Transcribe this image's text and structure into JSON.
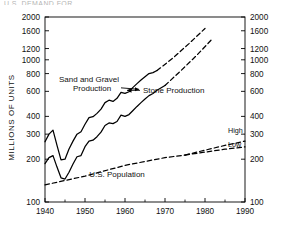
{
  "figure": {
    "top_cut_text": "U.S. DEMAND FOR",
    "frame": {
      "left": 45,
      "right": 245,
      "top": 17,
      "bottom": 202
    }
  },
  "chart_data": {
    "type": "line",
    "title": "",
    "subtitle": "",
    "xlabel": "",
    "ylabel": "MILLIONS OF UNITS",
    "yscale": "log",
    "xlim": [
      1940,
      1990
    ],
    "ylim": [
      100,
      2000
    ],
    "grid": false,
    "legend": "annotations-inline",
    "yticks": [
      100,
      200,
      300,
      400,
      600,
      800,
      1000,
      1200,
      1600,
      2000
    ],
    "ytick_labels": [
      "100",
      "200",
      "300",
      "400",
      "600",
      "800",
      "1000",
      "1200",
      "1600",
      "2000"
    ],
    "yticks_right": [
      100,
      200,
      300,
      400,
      600,
      800,
      1000,
      1200,
      1600,
      2000
    ],
    "ytick_labels_right": [
      "100",
      "200",
      "300",
      "400",
      "600",
      "800",
      "1000",
      "1200",
      "1600",
      "2000"
    ],
    "xticks": [
      1940,
      1950,
      1960,
      1970,
      1980,
      1990
    ],
    "xtick_labels": [
      "1940",
      "1950",
      "1960",
      "1970",
      "1980",
      "1990"
    ],
    "xticks_minor": [
      1945,
      1955,
      1965,
      1975,
      1985
    ],
    "annotations": [
      {
        "name": "sand-and-gravel-label",
        "text": "Sand and Gravel\nProduction",
        "line1": "Sand and Gravel",
        "line2": "Production",
        "x": 1943.5,
        "y": 700,
        "arrow": "right"
      },
      {
        "name": "stone-production-label",
        "text": "Stone Production",
        "x": 1964.5,
        "y": 610,
        "arrow": "left"
      },
      {
        "name": "us-population-label",
        "text": "U.S. Population",
        "x": 1958,
        "y": 150,
        "arrow": "none"
      },
      {
        "name": "high-branch-label",
        "text": "High",
        "x": 1985,
        "y": 300,
        "arrow": "none"
      },
      {
        "name": "low-branch-label",
        "text": "Low",
        "x": 1985,
        "y": 248,
        "arrow": "none"
      }
    ],
    "series": [
      {
        "name": "Sand and Gravel Production",
        "style": "solid",
        "color": "#000000",
        "x": [
          1940,
          1941,
          1942,
          1943,
          1944,
          1945,
          1946,
          1947,
          1948,
          1949,
          1950,
          1951,
          1952,
          1953,
          1954,
          1955,
          1956,
          1957,
          1958,
          1959,
          1960,
          1961,
          1962,
          1963,
          1964,
          1965,
          1966,
          1967,
          1968
        ],
        "values": [
          265,
          300,
          320,
          250,
          198,
          200,
          236,
          268,
          300,
          312,
          352,
          392,
          398,
          420,
          450,
          500,
          520,
          510,
          536,
          590,
          580,
          596,
          640,
          680,
          720,
          760,
          800,
          812,
          840
        ]
      },
      {
        "name": "Sand and Gravel Production (projected)",
        "style": "dashed",
        "color": "#000000",
        "x": [
          1968,
          1972,
          1976,
          1980
        ],
        "values": [
          840,
          1030,
          1300,
          1660
        ]
      },
      {
        "name": "Stone Production",
        "style": "solid",
        "color": "#000000",
        "x": [
          1940,
          1941,
          1942,
          1943,
          1944,
          1945,
          1946,
          1947,
          1948,
          1949,
          1950,
          1951,
          1952,
          1953,
          1954,
          1955,
          1956,
          1957,
          1958,
          1959,
          1960,
          1961,
          1962,
          1963,
          1964,
          1965,
          1966,
          1967,
          1968,
          1970
        ],
        "values": [
          186,
          205,
          212,
          176,
          148,
          145,
          162,
          185,
          208,
          212,
          245,
          268,
          272,
          288,
          310,
          345,
          360,
          356,
          368,
          408,
          400,
          412,
          440,
          470,
          500,
          530,
          560,
          580,
          610,
          660
        ]
      },
      {
        "name": "Stone Production (projected)",
        "style": "dashed",
        "color": "#000000",
        "x": [
          1970,
          1974,
          1978,
          1982
        ],
        "values": [
          660,
          840,
          1080,
          1420
        ]
      },
      {
        "name": "U.S. Population",
        "style": "dashed",
        "color": "#000000",
        "x": [
          1940,
          1950,
          1960,
          1970,
          1975
        ],
        "values": [
          132,
          152,
          181,
          205,
          214
        ]
      },
      {
        "name": "U.S. Population High",
        "style": "dashed",
        "color": "#000000",
        "x": [
          1975,
          1985,
          1990
        ],
        "values": [
          214,
          250,
          268
        ]
      },
      {
        "name": "U.S. Population Low",
        "style": "dashed",
        "color": "#000000",
        "x": [
          1975,
          1985,
          1990
        ],
        "values": [
          214,
          235,
          244
        ]
      }
    ]
  }
}
